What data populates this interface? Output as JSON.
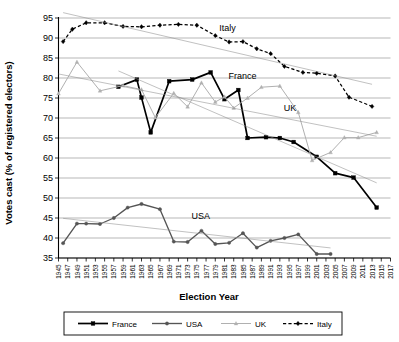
{
  "chart_data": {
    "type": "line",
    "title": "",
    "xlabel": "Election Year",
    "ylabel": "Votes cast (% of registered electors)",
    "xlim": [
      1945,
      2017
    ],
    "ylim": [
      33,
      96
    ],
    "yticks": [
      35,
      40,
      45,
      50,
      55,
      60,
      65,
      70,
      75,
      80,
      85,
      90,
      95
    ],
    "xticks": [
      1945,
      1947,
      1949,
      1951,
      1953,
      1955,
      1957,
      1959,
      1961,
      1963,
      1965,
      1967,
      1969,
      1971,
      1973,
      1975,
      1977,
      1979,
      1981,
      1983,
      1985,
      1987,
      1989,
      1991,
      1993,
      1995,
      1997,
      1999,
      2001,
      2003,
      2005,
      2007,
      2009,
      2011,
      2013,
      2015,
      2017
    ],
    "grid": true,
    "legend_position": "bottom",
    "annotations": [
      {
        "text": "Italy",
        "x": 1979,
        "y": 92.5
      },
      {
        "text": "France",
        "x": 1981,
        "y": 80.5
      },
      {
        "text": "UK",
        "x": 1993,
        "y": 72.5
      },
      {
        "text": "USA",
        "x": 1973,
        "y": 45.5
      }
    ],
    "series": [
      {
        "name": "France",
        "color": "#000000",
        "marker": "square",
        "dash": "solid",
        "points": [
          {
            "x": 1958,
            "y": 77.8
          },
          {
            "x": 1962,
            "y": 79.6
          },
          {
            "x": 1963,
            "y": 75.1
          },
          {
            "x": 1965,
            "y": 66.4
          },
          {
            "x": 1969,
            "y": 79.2
          },
          {
            "x": 1974,
            "y": 79.6
          },
          {
            "x": 1978,
            "y": 81.4
          },
          {
            "x": 1981,
            "y": 74.7
          },
          {
            "x": 1984,
            "y": 77.0
          },
          {
            "x": 1986,
            "y": 65.0
          },
          {
            "x": 1990,
            "y": 65.2
          },
          {
            "x": 1993,
            "y": 65.0
          },
          {
            "x": 1996,
            "y": 64.0
          },
          {
            "x": 2001,
            "y": 60.3
          },
          {
            "x": 2005,
            "y": 56.2
          },
          {
            "x": 2009,
            "y": 55.1
          },
          {
            "x": 2014,
            "y": 47.6
          }
        ]
      },
      {
        "name": "USA",
        "color": "#555555",
        "marker": "circle",
        "dash": "solid",
        "points": [
          {
            "x": 1946,
            "y": 38.7
          },
          {
            "x": 1949,
            "y": 43.6
          },
          {
            "x": 1951,
            "y": 43.6
          },
          {
            "x": 1954,
            "y": 43.5
          },
          {
            "x": 1957,
            "y": 45.0
          },
          {
            "x": 1960,
            "y": 47.6
          },
          {
            "x": 1963,
            "y": 48.5
          },
          {
            "x": 1967,
            "y": 47.2
          },
          {
            "x": 1970,
            "y": 39.1
          },
          {
            "x": 1973,
            "y": 39.0
          },
          {
            "x": 1976,
            "y": 41.8
          },
          {
            "x": 1979,
            "y": 38.5
          },
          {
            "x": 1982,
            "y": 38.8
          },
          {
            "x": 1985,
            "y": 41.2
          },
          {
            "x": 1988,
            "y": 37.6
          },
          {
            "x": 1991,
            "y": 39.3
          },
          {
            "x": 1994,
            "y": 40.0
          },
          {
            "x": 1997,
            "y": 40.9
          },
          {
            "x": 2001,
            "y": 36.0
          },
          {
            "x": 2004,
            "y": 36.0
          }
        ]
      },
      {
        "name": "UK",
        "color": "#b0b0b0",
        "marker": "triangle",
        "dash": "solid",
        "points": [
          {
            "x": 1945,
            "y": 76.1
          },
          {
            "x": 1949,
            "y": 84.0
          },
          {
            "x": 1954,
            "y": 76.8
          },
          {
            "x": 1959,
            "y": 78.1
          },
          {
            "x": 1963,
            "y": 77.1
          },
          {
            "x": 1966,
            "y": 70.1
          },
          {
            "x": 1970,
            "y": 76.2
          },
          {
            "x": 1973,
            "y": 72.8
          },
          {
            "x": 1976,
            "y": 78.8
          },
          {
            "x": 1979,
            "y": 74.0
          },
          {
            "x": 1981,
            "y": 75.3
          },
          {
            "x": 1983,
            "y": 72.5
          },
          {
            "x": 1986,
            "y": 75.0
          },
          {
            "x": 1989,
            "y": 77.7
          },
          {
            "x": 1993,
            "y": 78.0
          },
          {
            "x": 1997,
            "y": 71.4
          },
          {
            "x": 2000,
            "y": 59.4
          },
          {
            "x": 2004,
            "y": 61.4
          },
          {
            "x": 2007,
            "y": 65.1
          },
          {
            "x": 2010,
            "y": 65.1
          },
          {
            "x": 2014,
            "y": 66.4
          }
        ]
      },
      {
        "name": "Italy",
        "color": "#000000",
        "marker": "diamond",
        "dash": "dashed",
        "points": [
          {
            "x": 1946,
            "y": 89.1
          },
          {
            "x": 1948,
            "y": 92.2
          },
          {
            "x": 1951,
            "y": 93.8
          },
          {
            "x": 1955,
            "y": 93.8
          },
          {
            "x": 1959,
            "y": 92.9
          },
          {
            "x": 1963,
            "y": 92.8
          },
          {
            "x": 1967,
            "y": 93.2
          },
          {
            "x": 1971,
            "y": 93.4
          },
          {
            "x": 1975,
            "y": 93.2
          },
          {
            "x": 1979,
            "y": 90.6
          },
          {
            "x": 1982,
            "y": 89.0
          },
          {
            "x": 1985,
            "y": 89.1
          },
          {
            "x": 1988,
            "y": 87.3
          },
          {
            "x": 1991,
            "y": 86.1
          },
          {
            "x": 1994,
            "y": 82.9
          },
          {
            "x": 1998,
            "y": 81.4
          },
          {
            "x": 2001,
            "y": 81.2
          },
          {
            "x": 2005,
            "y": 80.5
          },
          {
            "x": 2008,
            "y": 75.2
          },
          {
            "x": 2013,
            "y": 72.9
          }
        ]
      }
    ]
  },
  "legend": {
    "entries": [
      {
        "label": "France"
      },
      {
        "label": "USA"
      },
      {
        "label": "UK"
      },
      {
        "label": "Italy"
      }
    ]
  }
}
